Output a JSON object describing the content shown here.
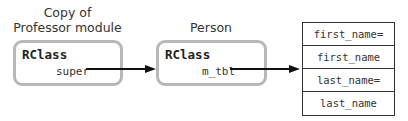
{
  "nodes": [
    {
      "id": "professor-copy",
      "caption_line1": "Copy of",
      "caption_line2": "Professor module",
      "title": "RClass",
      "field": "super"
    },
    {
      "id": "person",
      "caption_line1": "Person",
      "title": "RClass",
      "field": "m_tbl"
    }
  ],
  "method_table": {
    "rows": [
      "first_name=",
      "first_name",
      "last_name=",
      "last_name"
    ]
  },
  "edges": [
    {
      "from": "professor-copy.super",
      "to": "person"
    },
    {
      "from": "person.m_tbl",
      "to": "method_table"
    }
  ]
}
